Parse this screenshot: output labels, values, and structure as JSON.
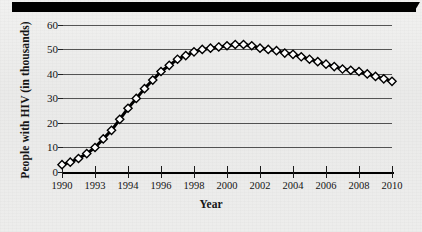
{
  "figure": {
    "background_color": "#ededec",
    "top_bar_color": "#000000",
    "ink_color": "#111111"
  },
  "chart_data": {
    "type": "line",
    "title": "",
    "xlabel": "Year",
    "ylabel": "People with HIV (in thousands)",
    "xlim": [
      1990,
      2010
    ],
    "ylim": [
      0,
      62
    ],
    "ytick_values": [
      0,
      10,
      20,
      30,
      40,
      50,
      60
    ],
    "ytick_labels": [
      "0",
      "10",
      "20",
      "30",
      "40",
      "50",
      "60"
    ],
    "xtick_values": [
      1990,
      1992,
      1994,
      1996,
      1998,
      2000,
      2002,
      2004,
      2006,
      2008,
      2010
    ],
    "xtick_labels": [
      "1990",
      "1993",
      "1994",
      "1996",
      "1998",
      "2000",
      "2002",
      "2004",
      "2006",
      "2008",
      "2010"
    ],
    "grid": true,
    "grid_axis": "y",
    "legend": false,
    "legend_position": "none",
    "marker": "open-diamond",
    "marker_face_color": "#ffffff",
    "marker_edge_color": "#000000",
    "line_color": "#000000",
    "line_width": 3,
    "series": [
      {
        "name": "People with HIV (in thousands)",
        "x": [
          1990,
          1990.5,
          1991,
          1991.5,
          1992,
          1992.5,
          1993,
          1993.5,
          1994,
          1994.5,
          1995,
          1995.5,
          1996,
          1996.5,
          1997,
          1997.5,
          1998,
          1998.5,
          1999,
          1999.5,
          2000,
          2000.5,
          2001,
          2001.5,
          2002,
          2002.5,
          2003,
          2003.5,
          2004,
          2004.5,
          2005,
          2005.5,
          2006,
          2006.5,
          2007,
          2007.5,
          2008,
          2008.5,
          2009,
          2009.5,
          2010
        ],
        "values": [
          3,
          4,
          5.5,
          7.5,
          10,
          13.5,
          17,
          21.5,
          26,
          30,
          34,
          37.5,
          41,
          43.5,
          46,
          47.5,
          49,
          50,
          50.5,
          51,
          51.5,
          52,
          52,
          51.5,
          50.5,
          50,
          49.5,
          48.5,
          48,
          47,
          46,
          45,
          44,
          43,
          42,
          41.5,
          41,
          40,
          39,
          38,
          37
        ]
      }
    ],
    "annotations": []
  }
}
